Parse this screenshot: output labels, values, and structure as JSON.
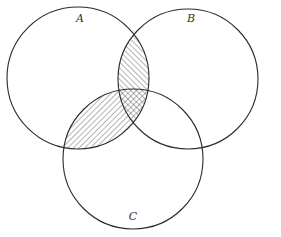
{
  "diagram": {
    "type": "venn",
    "sets": [
      {
        "id": "A",
        "label": "A",
        "cx": 78,
        "cy": 78,
        "r": 71,
        "label_x": 80,
        "label_y": 22
      },
      {
        "id": "B",
        "label": "B",
        "cx": 188,
        "cy": 79,
        "r": 70,
        "label_x": 191,
        "label_y": 22
      },
      {
        "id": "C",
        "label": "C",
        "cx": 133,
        "cy": 159,
        "r": 70,
        "label_x": 133,
        "label_y": 220
      }
    ],
    "shaded_regions": [
      {
        "region": "A∩B∩C'",
        "pattern": "diagonal-forward"
      },
      {
        "region": "A∩C∩B'",
        "pattern": "diagonal-backward"
      },
      {
        "region": "A∩B∩C",
        "pattern": "cross-hatch"
      }
    ],
    "colors": {
      "stroke": "#2a2a2a",
      "hatch": "#444444",
      "background": "#ffffff"
    }
  }
}
